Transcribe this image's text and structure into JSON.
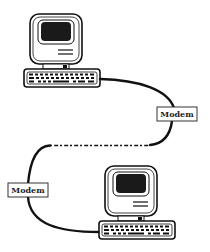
{
  "diagram": {
    "nodes": [
      {
        "id": "computer-top",
        "type": "computer"
      },
      {
        "id": "modem-right",
        "type": "modem",
        "label": "Modem"
      },
      {
        "id": "modem-left",
        "type": "modem",
        "label": "Modem"
      },
      {
        "id": "computer-bottom",
        "type": "computer"
      }
    ],
    "edges": [
      {
        "from": "computer-top",
        "to": "modem-right",
        "style": "solid"
      },
      {
        "from": "modem-right",
        "to": "modem-left",
        "style": "dotted"
      },
      {
        "from": "modem-left",
        "to": "computer-bottom",
        "style": "solid"
      }
    ],
    "colors": {
      "line": "#111111",
      "screen": "#1a1a1a",
      "background": "#ffffff"
    }
  }
}
